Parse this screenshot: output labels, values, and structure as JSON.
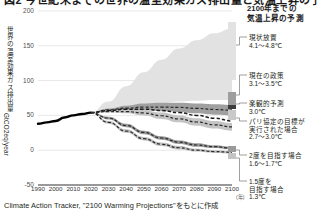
{
  "title": "図2 今世紀末までの世界の温室効果ガス排出量と気温上昇の予測",
  "axes": {
    "y_label": "世界の温室効果ガス排出量",
    "y_unit": "GtCO2eq/year",
    "y_ticks": [
      "200",
      "150",
      "100",
      "50",
      "0",
      "-50"
    ],
    "x_ticks": [
      "1990",
      "2000",
      "2010",
      "2020",
      "2030",
      "2040",
      "2050",
      "2060",
      "2070",
      "2080",
      "2090",
      "2100"
    ],
    "x_unit": "(年)"
  },
  "legend": {
    "title": "2100年までの\n気温上昇の予測",
    "title_line1": "2100年までの",
    "title_line2": "気温上昇の予測",
    "items": [
      {
        "name": "現状放置",
        "value": "4.1〜4.8℃",
        "color": "#dcdcdc"
      },
      {
        "name": "現在の政策",
        "value": "3.1〜3.5℃",
        "color": "#a8a8a8"
      },
      {
        "name": "楽観的予測",
        "value": "3.0℃",
        "color": "#5a5a5a"
      },
      {
        "name": "パリ協定の目標が\n実行された場合",
        "name_line1": "パリ協定の目標が",
        "name_line2": "実行された場合",
        "value": "2.7〜3.0℃",
        "color": "#8c8c8c"
      },
      {
        "name": "2度を目指す場合",
        "value": "1.6〜1.7℃",
        "color": "#909090"
      },
      {
        "name": "1.5度を\n目指す場合",
        "name_line1": "1.5度を",
        "name_line2": "目指す場合",
        "value": "1.3℃",
        "color": "#b4b4b4"
      }
    ]
  },
  "source": "Climate Action Tracker, \"2100 Warming Projections\"をもとに作成",
  "chart_data": {
    "type": "area",
    "title": "今世紀末までの世界の温室効果ガス排出量と気温上昇の予測",
    "xlabel": "(年)",
    "ylabel": "世界の温室効果ガス排出量 GtCO2eq/year",
    "xlim": [
      1990,
      2100
    ],
    "ylim": [
      -50,
      200
    ],
    "grid": true,
    "legend_position": "right",
    "x": [
      1990,
      2000,
      2010,
      2020,
      2030,
      2040,
      2050,
      2060,
      2070,
      2080,
      2090,
      2100
    ],
    "series": [
      {
        "name": "歴史的排出量",
        "type": "line",
        "style": "solid-black",
        "color": "#000000",
        "x": [
          1990,
          1995,
          2000,
          2005,
          2010,
          2015,
          2020
        ],
        "values": [
          38,
          40,
          42,
          47,
          50,
          52,
          54
        ]
      },
      {
        "name": "現状放置",
        "label": "現状放置 4.1〜4.8℃",
        "type": "band",
        "color": "#e2e2e2",
        "upper": [
          null,
          null,
          null,
          54,
          70,
          92,
          112,
          130,
          146,
          158,
          168,
          175
        ],
        "lower": [
          null,
          null,
          null,
          54,
          58,
          62,
          66,
          68,
          70,
          71,
          72,
          72
        ]
      },
      {
        "name": "現在の政策",
        "label": "現在の政策 3.1〜3.5℃",
        "type": "band",
        "color": "#a0a0a0",
        "upper": [
          null,
          null,
          null,
          54,
          60,
          64,
          67,
          68,
          68,
          67,
          66,
          65
        ],
        "lower": [
          null,
          null,
          null,
          54,
          56,
          57,
          57,
          56,
          55,
          53,
          51,
          50
        ]
      },
      {
        "name": "楽観的予測",
        "label": "楽観的予測 3.0℃",
        "type": "dashed-line",
        "color": "#222222",
        "values": [
          null,
          null,
          null,
          54,
          57,
          59,
          59,
          57,
          54,
          50,
          46,
          42
        ]
      },
      {
        "name": "パリ協定の目標が実行された場合",
        "label": "パリ協定の目標が実行された場合 2.7〜3.0℃",
        "type": "band",
        "color": "#c4c4c4",
        "upper": [
          null,
          null,
          null,
          54,
          57,
          58,
          57,
          54,
          50,
          46,
          42,
          39
        ],
        "lower": [
          null,
          null,
          null,
          54,
          54,
          53,
          50,
          45,
          40,
          35,
          31,
          28
        ]
      },
      {
        "name": "2度を目指す場合",
        "label": "2度を目指す場合 1.6〜1.7℃",
        "type": "band",
        "color": "#9a9a9a",
        "upper": [
          null,
          null,
          null,
          54,
          48,
          38,
          28,
          20,
          14,
          10,
          7,
          5
        ],
        "lower": [
          null,
          null,
          null,
          54,
          44,
          33,
          23,
          15,
          9,
          5,
          3,
          1
        ]
      },
      {
        "name": "1.5度を目指す場合",
        "label": "1.5度を目指す場合 1.3℃",
        "type": "band",
        "color": "#c0c0c0",
        "upper": [
          null,
          null,
          null,
          54,
          42,
          30,
          19,
          11,
          6,
          2,
          0,
          -1
        ],
        "lower": [
          null,
          null,
          null,
          54,
          38,
          25,
          14,
          6,
          1,
          -2,
          -4,
          -5
        ]
      }
    ]
  }
}
